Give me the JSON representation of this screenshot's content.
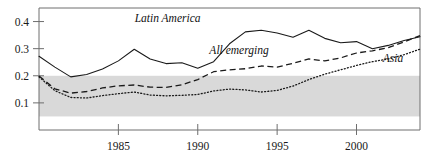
{
  "chart_data": {
    "type": "line",
    "title": "",
    "subtitle": "",
    "xlabel": "",
    "ylabel": "",
    "xlim": [
      1980,
      2004
    ],
    "ylim": [
      0.0,
      0.45
    ],
    "grid": false,
    "legend_position": "inline-annotations",
    "x_ticks": [
      1985,
      1990,
      1995,
      2000
    ],
    "x_tick_labels": [
      "1985",
      "1990",
      "1995",
      "2000"
    ],
    "y_ticks": [
      0.1,
      0.2,
      0.3,
      0.4
    ],
    "y_tick_labels": [
      "0.1",
      "0.2",
      "0.3",
      "0.4"
    ],
    "shaded_band": {
      "name": "reference-band",
      "y_from": 0.05,
      "y_to": 0.2,
      "color": "#d9d9d9"
    },
    "x": [
      1980,
      1981,
      1982,
      1983,
      1984,
      1985,
      1986,
      1987,
      1988,
      1989,
      1990,
      1991,
      1992,
      1993,
      1994,
      1995,
      1996,
      1997,
      1998,
      1999,
      2000,
      2001,
      2002,
      2003,
      2004
    ],
    "series": [
      {
        "name": "Latin America",
        "label": "Latin America",
        "style": "solid",
        "color": "#1a1a1a",
        "values": [
          0.272,
          0.232,
          0.196,
          0.205,
          0.225,
          0.255,
          0.298,
          0.262,
          0.245,
          0.248,
          0.228,
          0.252,
          0.318,
          0.362,
          0.368,
          0.358,
          0.342,
          0.368,
          0.338,
          0.322,
          0.326,
          0.3,
          0.312,
          0.33,
          0.344
        ]
      },
      {
        "name": "All emerging",
        "label": "All emerging",
        "style": "dashed",
        "color": "#1a1a1a",
        "values": [
          0.199,
          0.152,
          0.136,
          0.142,
          0.155,
          0.163,
          0.166,
          0.158,
          0.157,
          0.167,
          0.186,
          0.215,
          0.222,
          0.226,
          0.236,
          0.232,
          0.246,
          0.262,
          0.255,
          0.266,
          0.284,
          0.292,
          0.304,
          0.325,
          0.348
        ]
      },
      {
        "name": "Asia",
        "label": "Asia",
        "style": "dotted",
        "color": "#1a1a1a",
        "values": [
          0.196,
          0.145,
          0.12,
          0.118,
          0.127,
          0.134,
          0.14,
          0.129,
          0.126,
          0.128,
          0.131,
          0.144,
          0.151,
          0.148,
          0.14,
          0.146,
          0.162,
          0.186,
          0.206,
          0.222,
          0.238,
          0.252,
          0.262,
          0.278,
          0.298
        ]
      }
    ],
    "annotations": [
      {
        "name": "latin-america-label",
        "text": "Latin America",
        "x": 1988.1,
        "y": 0.398
      },
      {
        "name": "all-emerging-label",
        "text": "All emerging",
        "x": 1992.6,
        "y": 0.282
      },
      {
        "name": "asia-label",
        "text": "Asia",
        "x": 2002.3,
        "y": 0.25
      }
    ]
  },
  "axes": {
    "frame_color": "#6e6e6e",
    "tick_color": "#6e6e6e"
  }
}
